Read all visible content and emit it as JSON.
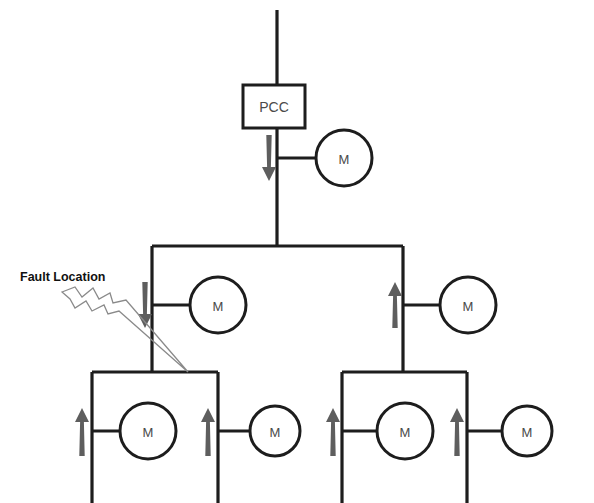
{
  "diagram": {
    "background_color": "#ffffff",
    "line_color": "#1d1d1d",
    "arrow_color": "#5e5e5e",
    "bolt_color": "#8a8a8a",
    "text_color": "#4a4a4a"
  },
  "annotations": {
    "fault_label": "Fault Location"
  },
  "pcc": {
    "label": "PCC",
    "x": 243,
    "y": 85,
    "width": 62,
    "height": 43
  },
  "motors": [
    {
      "id": "motor-pcc",
      "label": "M",
      "cx": 344,
      "cy": 158,
      "r": 28
    },
    {
      "id": "motor-mid-left",
      "label": "M",
      "cx": 218,
      "cy": 305,
      "r": 28
    },
    {
      "id": "motor-mid-right",
      "label": "M",
      "cx": 468,
      "cy": 305,
      "r": 28
    },
    {
      "id": "motor-bl-inner",
      "label": "M",
      "cx": 148,
      "cy": 431,
      "r": 28
    },
    {
      "id": "motor-bl-outer",
      "label": "M",
      "cx": 275,
      "cy": 431,
      "r": 25
    },
    {
      "id": "motor-br-inner",
      "label": "M",
      "cx": 405,
      "cy": 431,
      "r": 28
    },
    {
      "id": "motor-br-outer",
      "label": "M",
      "cx": 527,
      "cy": 431,
      "r": 25
    }
  ],
  "flow_arrows": [
    {
      "id": "arrow-pcc-feed",
      "direction": "down",
      "x": 269,
      "y_top": 135,
      "y_bottom": 180
    },
    {
      "id": "arrow-mid-left",
      "direction": "down",
      "x": 145,
      "y_top": 282,
      "y_bottom": 327
    },
    {
      "id": "arrow-mid-right",
      "direction": "up",
      "x": 395,
      "y_top": 282,
      "y_bottom": 327
    },
    {
      "id": "arrow-bl-left",
      "direction": "up",
      "x": 82,
      "y_top": 408,
      "y_bottom": 455
    },
    {
      "id": "arrow-bl-right",
      "direction": "up",
      "x": 208,
      "y_top": 408,
      "y_bottom": 455
    },
    {
      "id": "arrow-br-left",
      "direction": "up",
      "x": 333,
      "y_top": 408,
      "y_bottom": 455
    },
    {
      "id": "arrow-br-right",
      "direction": "up",
      "x": 457,
      "y_top": 408,
      "y_bottom": 455
    }
  ],
  "buses": [
    {
      "id": "bus-main-vertical",
      "orientation": "vertical",
      "x": 277,
      "y1": 10,
      "y2": 246
    },
    {
      "id": "bus-mid-horizontal",
      "orientation": "horizontal",
      "y": 246,
      "x1": 152,
      "x2": 403
    },
    {
      "id": "bus-mid-left-drop",
      "orientation": "vertical",
      "x": 152,
      "y1": 246,
      "y2": 372
    },
    {
      "id": "bus-mid-right-drop",
      "orientation": "vertical",
      "x": 403,
      "y1": 246,
      "y2": 372
    },
    {
      "id": "bus-bl-horizontal",
      "orientation": "horizontal",
      "y": 372,
      "x1": 92,
      "x2": 218
    },
    {
      "id": "bus-br-horizontal",
      "orientation": "horizontal",
      "y": 372,
      "x1": 342,
      "x2": 467
    },
    {
      "id": "bus-bl-left-drop",
      "orientation": "vertical",
      "x": 92,
      "y1": 372,
      "y2": 503
    },
    {
      "id": "bus-bl-right-drop",
      "orientation": "vertical",
      "x": 218,
      "y1": 372,
      "y2": 503
    },
    {
      "id": "bus-br-left-drop",
      "orientation": "vertical",
      "x": 342,
      "y1": 372,
      "y2": 503
    },
    {
      "id": "bus-br-right-drop",
      "orientation": "vertical",
      "x": 467,
      "y1": 372,
      "y2": 503
    }
  ],
  "fault": {
    "target_x": 188,
    "target_y": 372,
    "label_x": 20,
    "label_y": 277
  }
}
